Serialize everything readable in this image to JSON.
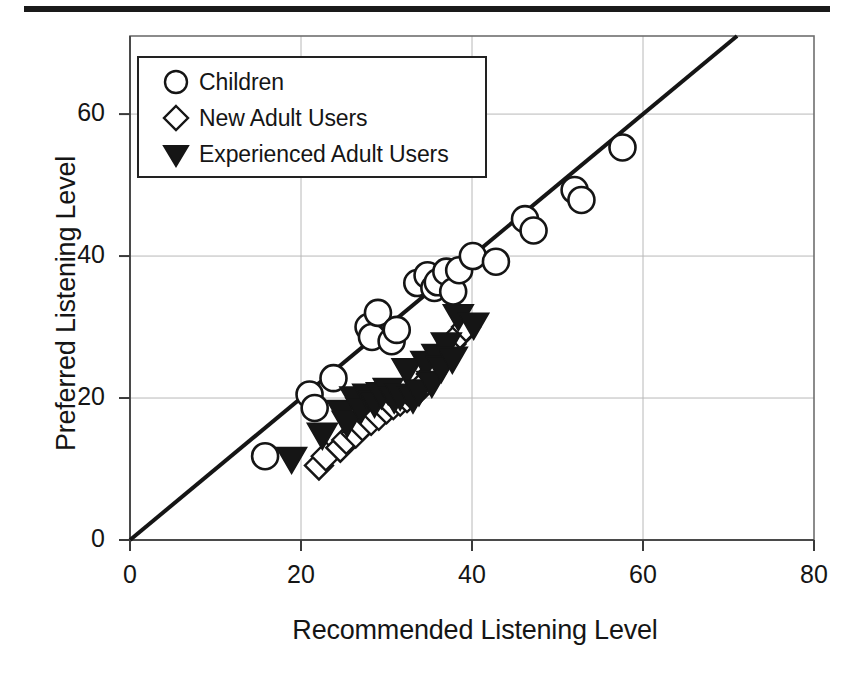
{
  "figure": {
    "top_rule": "horizontal-rule",
    "background_color": "#ffffff",
    "ink_color": "#151515"
  },
  "axes": {
    "x": {
      "title": "Recommended Listening Level",
      "ticks": [
        0,
        20,
        40,
        60,
        80
      ],
      "tick_labels": [
        "0",
        "20",
        "40",
        "60",
        "80"
      ],
      "min": 0,
      "max": 80
    },
    "y": {
      "title": "Preferred Listening Level",
      "ticks": [
        0,
        20,
        40,
        60
      ],
      "tick_labels": [
        "0",
        "20",
        "40",
        "60"
      ],
      "min": 0,
      "max": 71
    }
  },
  "legend": {
    "position": "top-left-inside",
    "entries": [
      {
        "label": "Children",
        "marker": "open-circle",
        "fill": "#ffffff",
        "stroke": "#151515"
      },
      {
        "label": "New Adult Users",
        "marker": "open-diamond",
        "fill": "#ffffff",
        "stroke": "#151515"
      },
      {
        "label": "Experienced Adult Users",
        "marker": "filled-down-triangle",
        "fill": "#151515",
        "stroke": "#151515"
      }
    ]
  },
  "chart_data": {
    "type": "scatter",
    "title": "",
    "xlabel": "Recommended Listening Level",
    "ylabel": "Preferred Listening Level",
    "xlim": [
      0,
      80
    ],
    "ylim": [
      0,
      71
    ],
    "xticks": [
      0,
      20,
      40,
      60,
      80
    ],
    "yticks": [
      0,
      20,
      40,
      60
    ],
    "grid": true,
    "grid_color": "#b8b8b8",
    "legend_position": "upper left",
    "reference_line": {
      "name": "identity-line",
      "label": "y = x",
      "slope": 1,
      "intercept": 0,
      "x_start": 0,
      "y_start": 0,
      "x_end": 71,
      "y_end": 71,
      "color": "#151515",
      "width": 4
    },
    "series": [
      {
        "name": "Children",
        "marker": "open-circle",
        "fill": "#ffffff",
        "stroke": "#151515",
        "points": [
          [
            15.8,
            11.8
          ],
          [
            21.0,
            20.5
          ],
          [
            21.6,
            18.6
          ],
          [
            23.8,
            22.8
          ],
          [
            27.9,
            30.0
          ],
          [
            28.3,
            28.6
          ],
          [
            29.0,
            32.0
          ],
          [
            30.6,
            28.0
          ],
          [
            31.2,
            29.6
          ],
          [
            33.6,
            36.2
          ],
          [
            34.8,
            37.3
          ],
          [
            35.6,
            35.5
          ],
          [
            36.0,
            36.3
          ],
          [
            37.0,
            37.8
          ],
          [
            37.8,
            35.0
          ],
          [
            38.5,
            38.0
          ],
          [
            40.1,
            40.0
          ],
          [
            42.8,
            39.2
          ],
          [
            46.2,
            45.2
          ],
          [
            47.2,
            43.6
          ],
          [
            52.0,
            49.3
          ],
          [
            52.8,
            47.9
          ],
          [
            57.6,
            55.3
          ]
        ]
      },
      {
        "name": "New Adult Users",
        "marker": "open-diamond",
        "fill": "#ffffff",
        "stroke": "#151515",
        "points": [
          [
            22.1,
            10.5
          ],
          [
            22.9,
            11.8
          ],
          [
            24.6,
            13.0
          ],
          [
            25.3,
            14.1
          ],
          [
            26.4,
            15.0
          ],
          [
            27.2,
            16.0
          ],
          [
            28.2,
            16.8
          ],
          [
            29.1,
            17.5
          ],
          [
            30.0,
            18.4
          ],
          [
            30.8,
            19.0
          ],
          [
            31.6,
            19.5
          ],
          [
            32.4,
            20.0
          ],
          [
            33.0,
            20.4
          ],
          [
            33.8,
            21.2
          ],
          [
            34.4,
            22.0
          ],
          [
            35.2,
            23.4
          ],
          [
            35.9,
            24.6
          ],
          [
            36.5,
            25.6
          ],
          [
            37.6,
            27.6
          ],
          [
            38.6,
            29.0
          ],
          [
            39.3,
            30.0
          ]
        ]
      },
      {
        "name": "Experienced Adult Users",
        "marker": "filled-down-triangle",
        "fill": "#151515",
        "stroke": "#151515",
        "points": [
          [
            18.9,
            11.5
          ],
          [
            22.5,
            14.9
          ],
          [
            24.8,
            18.1
          ],
          [
            25.4,
            16.6
          ],
          [
            26.3,
            20.0
          ],
          [
            27.0,
            18.5
          ],
          [
            27.8,
            20.4
          ],
          [
            28.6,
            19.4
          ],
          [
            29.4,
            20.6
          ],
          [
            30.2,
            21.2
          ],
          [
            30.9,
            20.0
          ],
          [
            31.6,
            20.4
          ],
          [
            32.4,
            24.0
          ],
          [
            33.1,
            20.0
          ],
          [
            33.8,
            21.0
          ],
          [
            34.6,
            25.0
          ],
          [
            35.3,
            22.2
          ],
          [
            35.9,
            26.0
          ],
          [
            36.4,
            24.3
          ],
          [
            37.0,
            27.6
          ],
          [
            37.7,
            25.6
          ],
          [
            38.4,
            31.6
          ],
          [
            40.2,
            30.4
          ]
        ]
      }
    ]
  }
}
